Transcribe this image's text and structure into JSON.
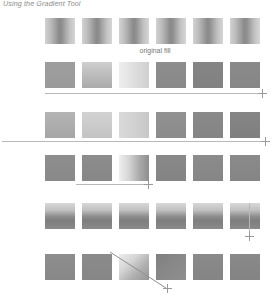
{
  "figure": {
    "title": "Using the Gradient Tool",
    "caption_original_fill": "original fill",
    "background": "#ffffff",
    "swatch": {
      "width": 30,
      "height": 26,
      "gap": 7,
      "start_x": 45,
      "count_per_row": 6
    },
    "line_color": "#b9b9b9",
    "text_color": "#8c8c8c"
  },
  "rows": [
    {
      "name": "original-fill-row",
      "y": 18,
      "guide": null,
      "caption": "original fill",
      "swatches": [
        {
          "name": "swatch-reflected-1",
          "fill": "linear-gradient(90deg,#d2d2d2 0%,#bdbdbd 18%,#8a8a8a 48%,#8f8f8f 56%,#c2c2c2 82%,#d6d6d6 100%)"
        },
        {
          "name": "swatch-reflected-2",
          "fill": "linear-gradient(90deg,#d2d2d2 0%,#bdbdbd 18%,#8a8a8a 48%,#8f8f8f 56%,#c2c2c2 82%,#d6d6d6 100%)"
        },
        {
          "name": "swatch-reflected-3",
          "fill": "linear-gradient(90deg,#d2d2d2 0%,#bdbdbd 18%,#8a8a8a 48%,#8f8f8f 56%,#c2c2c2 82%,#d6d6d6 100%)"
        },
        {
          "name": "swatch-reflected-4",
          "fill": "linear-gradient(90deg,#d2d2d2 0%,#bdbdbd 18%,#8a8a8a 48%,#8f8f8f 56%,#c2c2c2 82%,#d6d6d6 100%)"
        },
        {
          "name": "swatch-reflected-5",
          "fill": "linear-gradient(90deg,#d2d2d2 0%,#bdbdbd 18%,#8a8a8a 48%,#8f8f8f 56%,#c2c2c2 82%,#d6d6d6 100%)"
        },
        {
          "name": "swatch-reflected-6",
          "fill": "linear-gradient(90deg,#d2d2d2 0%,#bdbdbd 18%,#8a8a8a 48%,#8f8f8f 56%,#c2c2c2 82%,#d6d6d6 100%)"
        }
      ]
    },
    {
      "name": "linear-horizontal-row",
      "y": 62,
      "guide": {
        "type": "horizontal",
        "x": 45,
        "y": 93,
        "length": 216,
        "marker_x": 258,
        "marker_y": 89
      },
      "caption": null,
      "swatches": [
        {
          "name": "swatch-solid-gray-1",
          "fill": "linear-gradient(180deg,#9e9e9e,#9a9a9a)"
        },
        {
          "name": "swatch-gradient-light-2",
          "fill": "linear-gradient(180deg,#cfcfcf,#a9a9a9)"
        },
        {
          "name": "swatch-gradient-lightest-3",
          "fill": "linear-gradient(90deg,#eeeeee,#cfcfcf)"
        },
        {
          "name": "swatch-solid-dark-4",
          "fill": "linear-gradient(180deg,#8d8d8d,#898989)"
        },
        {
          "name": "swatch-solid-darker-5",
          "fill": "linear-gradient(180deg,#858585,#818181)"
        },
        {
          "name": "swatch-solid-darkest-6",
          "fill": "linear-gradient(180deg,#8a8a8a,#868686)"
        }
      ]
    },
    {
      "name": "linear-long-drag-row",
      "y": 112,
      "guide": {
        "type": "horizontal",
        "x": 2,
        "y": 141,
        "length": 262,
        "marker_x": 261,
        "marker_y": 137
      },
      "caption": null,
      "swatches": [
        {
          "name": "swatch-midgray-1",
          "fill": "linear-gradient(180deg,#b4b4b4,#a6a6a6)"
        },
        {
          "name": "swatch-light-2",
          "fill": "linear-gradient(180deg,#d2d2d2,#c4c4c4)"
        },
        {
          "name": "swatch-lighter-3",
          "fill": "linear-gradient(90deg,#dadada,#c8c8c8)"
        },
        {
          "name": "swatch-dark-4",
          "fill": "linear-gradient(180deg,#919191,#8b8b8b)"
        },
        {
          "name": "swatch-darker-5",
          "fill": "linear-gradient(180deg,#8a8a8a,#848484)"
        },
        {
          "name": "swatch-darkest-6",
          "fill": "linear-gradient(180deg,#858585,#7f7f7f)"
        }
      ]
    },
    {
      "name": "short-drag-row",
      "y": 155,
      "guide": {
        "type": "horizontal",
        "x": 76,
        "y": 184,
        "length": 71,
        "marker_x": 144,
        "marker_y": 180
      },
      "caption": null,
      "swatches": [
        {
          "name": "swatch-solid-1",
          "fill": "linear-gradient(180deg,#8e8e8e,#898989)"
        },
        {
          "name": "swatch-solid-2",
          "fill": "linear-gradient(180deg,#8c8c8c,#878787)"
        },
        {
          "name": "swatch-horizontal-gradient-3",
          "fill": "linear-gradient(90deg,#efefef 0%,#d8d8d8 30%,#a8a8a8 70%,#8e8e8e 100%)"
        },
        {
          "name": "swatch-solid-4",
          "fill": "linear-gradient(180deg,#898989,#848484)"
        },
        {
          "name": "swatch-solid-5",
          "fill": "linear-gradient(180deg,#8b8b8b,#868686)"
        },
        {
          "name": "swatch-solid-6",
          "fill": "linear-gradient(180deg,#8a8a8a,#858585)"
        }
      ]
    },
    {
      "name": "vertical-drag-row",
      "y": 203,
      "guide": {
        "type": "vertical",
        "x": 249,
        "y": 203,
        "length": 30,
        "marker_x": 245,
        "marker_y": 232
      },
      "caption": null,
      "swatches": [
        {
          "name": "swatch-vertical-gradient-1",
          "fill": "linear-gradient(180deg,#d8d8d8 0%,#c0c0c0 28%,#8d8d8d 52%,#7e7e7e 68%,#8a8a8a 100%)"
        },
        {
          "name": "swatch-vertical-gradient-2",
          "fill": "linear-gradient(180deg,#d8d8d8 0%,#c0c0c0 28%,#8d8d8d 52%,#7e7e7e 68%,#8a8a8a 100%)"
        },
        {
          "name": "swatch-vertical-gradient-3",
          "fill": "linear-gradient(180deg,#d8d8d8 0%,#c0c0c0 28%,#8d8d8d 52%,#7e7e7e 68%,#8a8a8a 100%)"
        },
        {
          "name": "swatch-vertical-gradient-4",
          "fill": "linear-gradient(180deg,#d8d8d8 0%,#c0c0c0 28%,#8d8d8d 52%,#7e7e7e 68%,#8a8a8a 100%)"
        },
        {
          "name": "swatch-vertical-gradient-5",
          "fill": "linear-gradient(180deg,#d8d8d8 0%,#c0c0c0 28%,#8d8d8d 52%,#7e7e7e 68%,#8a8a8a 100%)"
        },
        {
          "name": "swatch-vertical-gradient-6",
          "fill": "linear-gradient(180deg,#d8d8d8 0%,#c0c0c0 28%,#8d8d8d 52%,#7e7e7e 68%,#8a8a8a 100%)"
        }
      ]
    },
    {
      "name": "diagonal-drag-row",
      "y": 254,
      "guide": {
        "type": "diagonal",
        "x1": 110,
        "y1": 252,
        "x2": 166,
        "y2": 288,
        "marker_x": 163,
        "marker_y": 284
      },
      "caption": null,
      "swatches": [
        {
          "name": "swatch-solid-1",
          "fill": "linear-gradient(180deg,#8d8d8d,#888888)"
        },
        {
          "name": "swatch-solid-2",
          "fill": "linear-gradient(180deg,#8b8b8b,#868686)"
        },
        {
          "name": "swatch-diagonal-gradient-3",
          "fill": "linear-gradient(135deg,#ededed 0%,#d5d5d5 35%,#b0b0b0 65%,#959595 100%)"
        },
        {
          "name": "swatch-diagonal-gradient-4",
          "fill": "linear-gradient(135deg,#7f7f7f 0%,#878787 40%,#8f8f8f 100%)"
        },
        {
          "name": "swatch-solid-5",
          "fill": "linear-gradient(180deg,#8a8a8a,#858585)"
        },
        {
          "name": "swatch-solid-6",
          "fill": "linear-gradient(180deg,#898989,#848484)"
        }
      ]
    }
  ]
}
